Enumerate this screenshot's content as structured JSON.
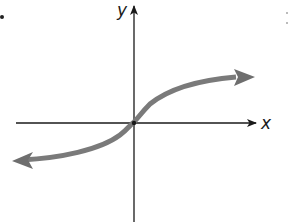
{
  "figure": {
    "x_axis_label": "x",
    "y_axis_label": "y",
    "colors": {
      "axis": "#1a1a1a",
      "curve": "#7a7a7a",
      "background": "#ffffff"
    },
    "origin_px": [
      134,
      123
    ],
    "curve_endpoints_px": {
      "lower_left": [
        12,
        162
      ],
      "upper_right": [
        255,
        78
      ]
    }
  }
}
